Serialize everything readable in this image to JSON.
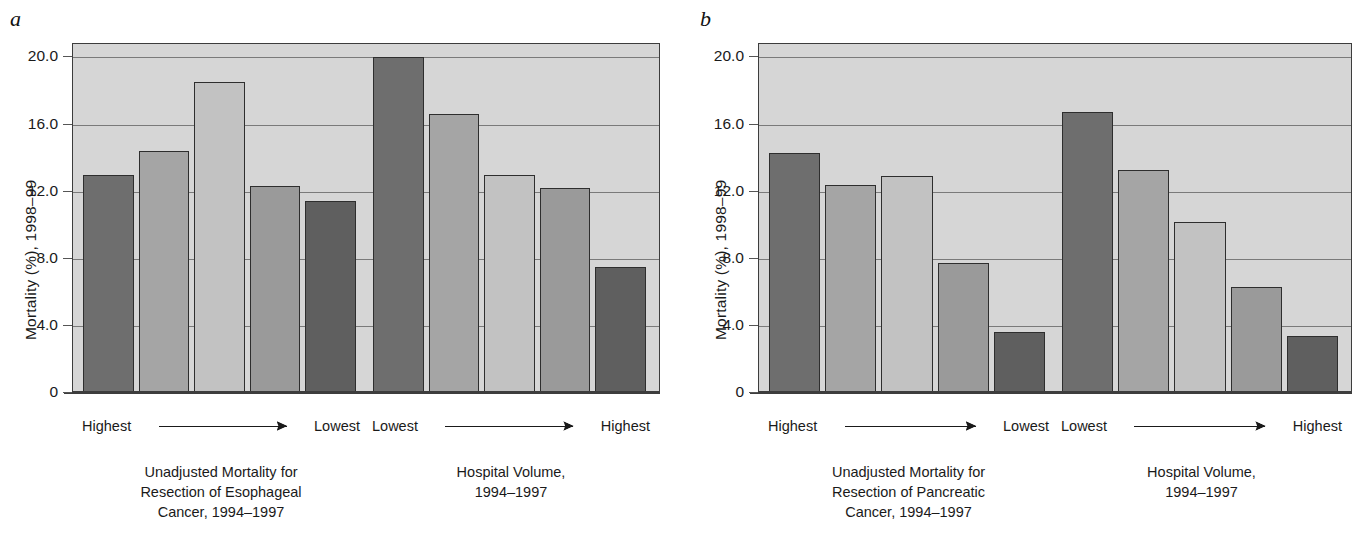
{
  "figure": {
    "panels": [
      {
        "letter": "a",
        "y_axis_title": "Mortality (%), 1998–99",
        "y_ticks": [
          "20.0",
          "16.0",
          "12.0",
          "8.0",
          "4.0",
          "0"
        ],
        "groups": [
          {
            "left_label": "Highest",
            "right_label": "Lowest",
            "caption": "Unadjusted Mortality for\nResection of Esophageal\nCancer, 1994–1997"
          },
          {
            "left_label": "Lowest",
            "right_label": "Highest",
            "caption": "Hospital Volume,\n1994–1997"
          }
        ]
      },
      {
        "letter": "b",
        "y_axis_title": "Mortality (%), 1998–99",
        "y_ticks": [
          "20.0",
          "16.0",
          "12.0",
          "8.0",
          "4.0",
          "0"
        ],
        "groups": [
          {
            "left_label": "Highest",
            "right_label": "Lowest",
            "caption": "Unadjusted Mortality for\nResection of Pancreatic\nCancer, 1994–1997"
          },
          {
            "left_label": "Lowest",
            "right_label": "Highest",
            "caption": "Hospital Volume,\n1994–1997"
          }
        ]
      }
    ]
  },
  "chart_data": [
    {
      "type": "bar",
      "panel": "a",
      "title": "Esophageal Cancer Resection",
      "xlabel": "",
      "ylabel": "Mortality (%), 1998–99",
      "ylim": [
        0,
        20.8
      ],
      "yticks": [
        0,
        4,
        8,
        12,
        16,
        20
      ],
      "grid": true,
      "legend": "none",
      "categories": [
        "Mortality Q1 (Highest)",
        "Mortality Q2",
        "Mortality Q3",
        "Mortality Q4",
        "Mortality Q5 (Lowest)",
        "Volume Q1 (Lowest)",
        "Volume Q2",
        "Volume Q3",
        "Volume Q4",
        "Volume Q5 (Highest)"
      ],
      "values": [
        12.9,
        14.3,
        18.4,
        12.2,
        11.3,
        19.9,
        16.5,
        12.9,
        12.1,
        7.4
      ],
      "bar_colors": [
        "#6e6e6e",
        "#a5a5a5",
        "#c2c2c2",
        "#9a9a9a",
        "#5f5f5f",
        "#6e6e6e",
        "#a5a5a5",
        "#c2c2c2",
        "#9a9a9a",
        "#5f5f5f"
      ],
      "group_break_after_index": 4
    },
    {
      "type": "bar",
      "panel": "b",
      "title": "Pancreatic Cancer Resection",
      "xlabel": "",
      "ylabel": "Mortality (%), 1998–99",
      "ylim": [
        0,
        20.8
      ],
      "yticks": [
        0,
        4,
        8,
        12,
        16,
        20
      ],
      "grid": true,
      "legend": "none",
      "categories": [
        "Mortality Q1 (Highest)",
        "Mortality Q2",
        "Mortality Q3",
        "Mortality Q4",
        "Mortality Q5 (Lowest)",
        "Volume Q1 (Lowest)",
        "Volume Q2",
        "Volume Q3",
        "Volume Q4",
        "Volume Q5 (Highest)"
      ],
      "values": [
        14.2,
        12.3,
        12.8,
        7.6,
        3.5,
        16.6,
        13.2,
        10.1,
        6.2,
        3.3
      ],
      "bar_colors": [
        "#6e6e6e",
        "#a5a5a5",
        "#c2c2c2",
        "#9a9a9a",
        "#5f5f5f",
        "#6e6e6e",
        "#a5a5a5",
        "#c2c2c2",
        "#9a9a9a",
        "#5f5f5f"
      ],
      "group_break_after_index": 4
    }
  ]
}
